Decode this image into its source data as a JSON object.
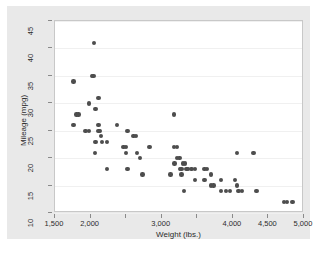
{
  "chart_data": {
    "type": "scatter",
    "title": "",
    "xlabel": "Weight (lbs.)",
    "ylabel": "Mileage (mpg)",
    "xlim": [
      1500,
      5000
    ],
    "ylim": [
      10,
      45
    ],
    "xticks": [
      1500,
      2000,
      2500,
      3000,
      3500,
      4000,
      4500,
      5000
    ],
    "xticklabels": [
      "1,500",
      "2,000",
      "",
      "3,000",
      "",
      "4,000",
      "4,500",
      "5,000"
    ],
    "yticks": [
      10,
      15,
      20,
      25,
      30,
      35,
      40,
      45
    ],
    "yticklabels": [
      "10",
      "15",
      "20",
      "25",
      "30",
      "35",
      "40",
      "45"
    ],
    "grid": "horizontal",
    "legend": "none",
    "marker_color": "#4d4d4d",
    "marker_shape": "circle",
    "plot_background": "#ffffff",
    "surround_background": "#e9e9e9",
    "gridline_color": "#f0f0f0",
    "points": [
      {
        "x": 1760,
        "y": 34
      },
      {
        "x": 1800,
        "y": 28
      },
      {
        "x": 1830,
        "y": 28
      },
      {
        "x": 1760,
        "y": 26
      },
      {
        "x": 1930,
        "y": 25
      },
      {
        "x": 1980,
        "y": 25
      },
      {
        "x": 1980,
        "y": 30
      },
      {
        "x": 2020,
        "y": 35
      },
      {
        "x": 2040,
        "y": 35
      },
      {
        "x": 2050,
        "y": 41
      },
      {
        "x": 2070,
        "y": 29
      },
      {
        "x": 2110,
        "y": 31
      },
      {
        "x": 2110,
        "y": 25
      },
      {
        "x": 2130,
        "y": 25
      },
      {
        "x": 2150,
        "y": 24
      },
      {
        "x": 2070,
        "y": 23
      },
      {
        "x": 2160,
        "y": 23
      },
      {
        "x": 2060,
        "y": 21
      },
      {
        "x": 2110,
        "y": 26
      },
      {
        "x": 2230,
        "y": 23
      },
      {
        "x": 2230,
        "y": 18
      },
      {
        "x": 2370,
        "y": 26
      },
      {
        "x": 2460,
        "y": 22
      },
      {
        "x": 2500,
        "y": 22
      },
      {
        "x": 2500,
        "y": 21
      },
      {
        "x": 2520,
        "y": 25
      },
      {
        "x": 2600,
        "y": 24
      },
      {
        "x": 2640,
        "y": 24
      },
      {
        "x": 2650,
        "y": 21
      },
      {
        "x": 2520,
        "y": 18
      },
      {
        "x": 2690,
        "y": 20
      },
      {
        "x": 2730,
        "y": 17
      },
      {
        "x": 2830,
        "y": 22
      },
      {
        "x": 3170,
        "y": 28
      },
      {
        "x": 3170,
        "y": 22
      },
      {
        "x": 3210,
        "y": 22
      },
      {
        "x": 3180,
        "y": 19
      },
      {
        "x": 3210,
        "y": 20
      },
      {
        "x": 3250,
        "y": 20
      },
      {
        "x": 3120,
        "y": 17
      },
      {
        "x": 3260,
        "y": 18
      },
      {
        "x": 3280,
        "y": 18
      },
      {
        "x": 3300,
        "y": 19
      },
      {
        "x": 3330,
        "y": 19
      },
      {
        "x": 3350,
        "y": 18
      },
      {
        "x": 3370,
        "y": 18
      },
      {
        "x": 3280,
        "y": 17
      },
      {
        "x": 3310,
        "y": 14
      },
      {
        "x": 3420,
        "y": 18
      },
      {
        "x": 3470,
        "y": 18
      },
      {
        "x": 3600,
        "y": 18
      },
      {
        "x": 3640,
        "y": 18
      },
      {
        "x": 3470,
        "y": 16
      },
      {
        "x": 3600,
        "y": 16
      },
      {
        "x": 3690,
        "y": 17
      },
      {
        "x": 3690,
        "y": 15
      },
      {
        "x": 3730,
        "y": 15
      },
      {
        "x": 3830,
        "y": 16
      },
      {
        "x": 3830,
        "y": 14
      },
      {
        "x": 3900,
        "y": 14
      },
      {
        "x": 3960,
        "y": 14
      },
      {
        "x": 4030,
        "y": 16
      },
      {
        "x": 4060,
        "y": 21
      },
      {
        "x": 4060,
        "y": 15
      },
      {
        "x": 4080,
        "y": 14
      },
      {
        "x": 4130,
        "y": 14
      },
      {
        "x": 4290,
        "y": 21
      },
      {
        "x": 4330,
        "y": 14
      },
      {
        "x": 4720,
        "y": 12
      },
      {
        "x": 4760,
        "y": 12
      },
      {
        "x": 4840,
        "y": 12
      }
    ]
  }
}
